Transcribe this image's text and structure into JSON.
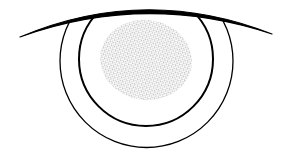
{
  "diagram": {
    "title": "Eye diagram",
    "elements": [
      {
        "name": "eyelid",
        "shape": "curve",
        "color": "#000000"
      },
      {
        "name": "outer-ring",
        "shape": "circle",
        "color": "#000000"
      },
      {
        "name": "inner-ring",
        "shape": "circle",
        "color": "#000000"
      },
      {
        "name": "stippled-spot",
        "shape": "ellipse",
        "fill": "stipple",
        "color": "#555555"
      }
    ],
    "colors": {
      "background": "#ffffff",
      "stroke": "#000000",
      "stipple": "#666666"
    }
  }
}
